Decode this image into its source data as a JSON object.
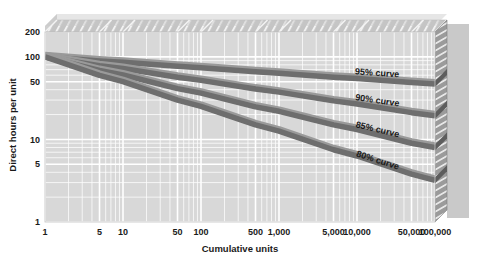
{
  "chart_data": {
    "type": "line",
    "title": "",
    "xlabel": "Cumulative units",
    "ylabel": "Direct hours per unit",
    "xscale": "log",
    "yscale": "log",
    "xlim": [
      1,
      100000
    ],
    "ylim": [
      1,
      200
    ],
    "grid": true,
    "legend_position": "inline-right",
    "x_ticks": [
      "1",
      "5",
      "10",
      "50",
      "100",
      "500",
      "1,000",
      "5,000",
      "10,000",
      "50,000",
      "100,000"
    ],
    "x_tick_values": [
      1,
      5,
      10,
      50,
      100,
      500,
      1000,
      5000,
      10000,
      50000,
      100000
    ],
    "y_ticks": [
      "200",
      "100",
      "50",
      "10",
      "5",
      "1"
    ],
    "y_tick_values": [
      200,
      100,
      50,
      10,
      5,
      1
    ],
    "origin_point": {
      "x": 1,
      "y": 100
    },
    "series": [
      {
        "name": "95% curve",
        "label": "95% curve",
        "learning_rate": 0.95,
        "color": "#6e6e6e",
        "x": [
          1,
          5,
          10,
          50,
          100,
          500,
          1000,
          5000,
          10000,
          50000,
          100000
        ],
        "values": [
          100,
          89.3,
          85.9,
          76.8,
          73.9,
          66.0,
          63.5,
          56.7,
          54.6,
          48.8,
          46.9
        ]
      },
      {
        "name": "90% curve",
        "label": "90% curve",
        "learning_rate": 0.9,
        "color": "#6e6e6e",
        "x": [
          1,
          5,
          10,
          50,
          100,
          500,
          1000,
          5000,
          10000,
          50000,
          100000
        ],
        "values": [
          100,
          78.3,
          72.2,
          56.5,
          51.9,
          40.7,
          37.4,
          29.3,
          26.9,
          21.1,
          19.4
        ]
      },
      {
        "name": "85% curve",
        "label": "85% curve",
        "learning_rate": 0.85,
        "color": "#6e6e6e",
        "x": [
          1,
          5,
          10,
          50,
          100,
          500,
          1000,
          5000,
          10000,
          50000,
          100000
        ],
        "values": [
          100,
          68.3,
          60.3,
          41.2,
          36.4,
          24.8,
          21.9,
          15.0,
          13.2,
          9.0,
          8.0
        ]
      },
      {
        "name": "80% curve",
        "label": "80% curve",
        "learning_rate": 0.8,
        "color": "#6e6e6e",
        "x": [
          1,
          5,
          10,
          50,
          100,
          500,
          1000,
          5000,
          10000,
          50000,
          100000
        ],
        "values": [
          100,
          59.6,
          50.1,
          29.9,
          25.1,
          15.0,
          12.6,
          7.5,
          6.3,
          3.8,
          3.2
        ]
      }
    ]
  },
  "style": {
    "page_background": "#ffffff",
    "plot_face": "#d8d8d8",
    "plot_top": "#c0c0c0",
    "plot_right_wall": "#8f8f8f",
    "gridline": "#ffffff",
    "curve_color": "#6e6e6e",
    "curve_highlight": "#9a9a9a",
    "axis_text": "#1a1a1a",
    "shadow": "#c9c9c9"
  }
}
